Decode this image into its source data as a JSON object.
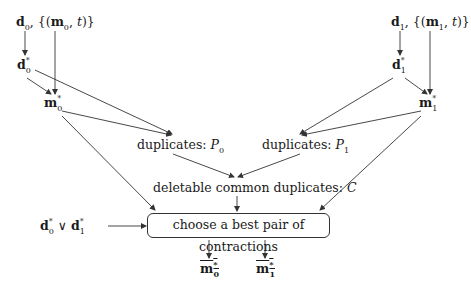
{
  "nodes": {
    "input0": {
      "d": "d",
      "sub": "0",
      "sep": ", {(",
      "m": "m",
      "msub": "0",
      "t": "t",
      "close": ")}"
    },
    "input1": {
      "d": "d",
      "sub": "1",
      "sep": ", {(",
      "m": "m",
      "msub": "1",
      "t": "t",
      "close": ")}"
    },
    "d0star": {
      "base": "d",
      "sup": "*",
      "sub": "0"
    },
    "d1star": {
      "base": "d",
      "sup": "*",
      "sub": "1"
    },
    "m0star": {
      "base": "m",
      "sup": "*",
      "sub": "0"
    },
    "m1star": {
      "base": "m",
      "sup": "*",
      "sub": "1"
    },
    "dup0": {
      "text": "duplicates: ",
      "var": "P",
      "sub": "0"
    },
    "dup1": {
      "text": "duplicates: ",
      "var": "P",
      "sub": "1"
    },
    "common": {
      "text": "deletable common duplicates: ",
      "var": "C"
    },
    "or": {
      "a": "d",
      "asub": "0",
      "sup": "*",
      "op": " ∨ ",
      "b": "d",
      "bsub": "1"
    },
    "choose": {
      "text": "choose a best pair of contractions"
    },
    "out0": {
      "base": "m",
      "sup": "*",
      "sub": "0"
    },
    "out1": {
      "base": "m",
      "sup": "*",
      "sub": "1"
    }
  },
  "colors": {
    "line": "#333333",
    "text": "#1a1a1a",
    "background": "#ffffff"
  }
}
